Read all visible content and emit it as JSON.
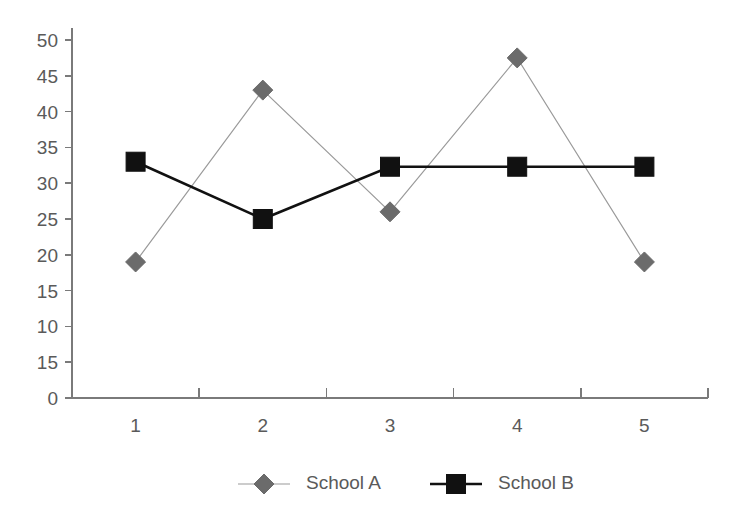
{
  "chart_data": {
    "type": "line",
    "title": "",
    "xlabel": "",
    "ylabel": "",
    "categories": [
      "1",
      "2",
      "3",
      "4",
      "5"
    ],
    "ylim": [
      0,
      50
    ],
    "y_tick_labels": [
      "50",
      "45",
      "40",
      "35",
      "30",
      "25",
      "20",
      "15",
      "10",
      "15",
      "0"
    ],
    "y_tick_values": [
      50,
      45,
      40,
      35,
      30,
      25,
      20,
      15,
      10,
      5,
      0
    ],
    "grid": false,
    "legend_position": "bottom",
    "series": [
      {
        "name": "School A",
        "values": [
          19,
          43,
          26,
          47.5,
          19
        ],
        "color": "#6b6b6b",
        "line_color": "#9a9a9a",
        "marker": "diamond"
      },
      {
        "name": "School B",
        "values": [
          33,
          25,
          32.3,
          32.3,
          32.3
        ],
        "color": "#111111",
        "line_color": "#111111",
        "marker": "square"
      }
    ]
  },
  "legend": {
    "items": [
      {
        "label": "School A"
      },
      {
        "label": "School B"
      }
    ]
  },
  "colors": {
    "axis": "#7a7a7a",
    "text": "#5a5a5a",
    "background": "#ffffff"
  }
}
